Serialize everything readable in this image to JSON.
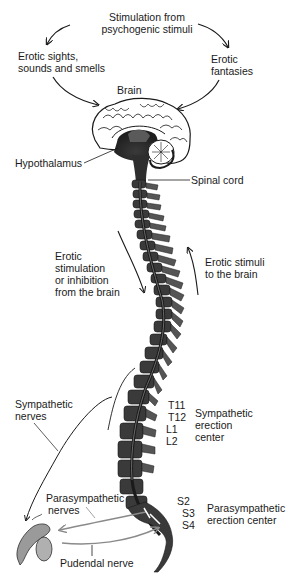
{
  "diagram": {
    "labels": {
      "psychogenic": [
        "Stimulation from",
        "psychogenic stimuli"
      ],
      "sights": [
        "Erotic sights,",
        "sounds and smells"
      ],
      "fantasies": [
        "Erotic",
        "fantasies"
      ],
      "brain": "Brain",
      "hypothalamus": "Hypothalamus",
      "spinal_cord": "Spinal cord",
      "descending": [
        "Erotic",
        "stimulation",
        "or inhibition",
        "from the brain"
      ],
      "ascending": [
        "Erotic stimuli",
        "to the brain"
      ],
      "sympathetic_nerves": [
        "Sympathetic",
        "nerves"
      ],
      "vertebrae_upper": [
        "T11",
        "T12",
        "L1",
        "L2"
      ],
      "sympathetic_center": [
        "Sympathetic",
        "erection",
        "center"
      ],
      "parasympathetic_nerves": [
        "Parasympathetic",
        "nerves"
      ],
      "vertebrae_sacral": [
        "S2",
        "S3",
        "S4"
      ],
      "parasympathetic_center": [
        "Parasympathetic",
        "erection center"
      ],
      "pudendal": "Pudendal nerve"
    },
    "colors": {
      "ink": "#1a1a1a",
      "spine_dark": "#2e2e2e",
      "spine_mid": "#555555",
      "nerve_gray": "#8a8a8a"
    }
  }
}
